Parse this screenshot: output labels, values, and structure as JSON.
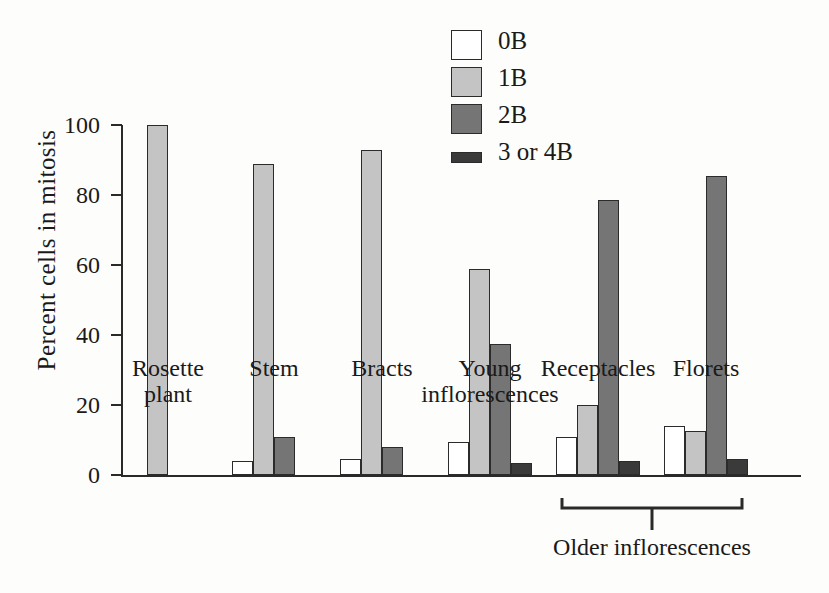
{
  "chart_data": {
    "type": "bar",
    "title": "",
    "xlabel": "",
    "ylabel": "Percent cells in mitosis",
    "ylim": [
      0,
      100
    ],
    "yticks": [
      0,
      20,
      40,
      60,
      80,
      100
    ],
    "grid": false,
    "legend_position": "top-center-right",
    "categories": [
      "Rosette plant",
      "Stem",
      "Bracts",
      "Young inflorescences",
      "Receptacles",
      "Florets"
    ],
    "category_lines": [
      [
        "Rosette",
        "plant"
      ],
      [
        "Stem",
        ""
      ],
      [
        "Bracts",
        ""
      ],
      [
        "Young",
        "inflorescences"
      ],
      [
        "Receptacles",
        ""
      ],
      [
        "Florets",
        ""
      ]
    ],
    "series": [
      {
        "name": "0B",
        "color": "#ffffff",
        "values": [
          0,
          4,
          4.5,
          9.5,
          11,
          14
        ]
      },
      {
        "name": "1B",
        "color": "#c4c4c4",
        "values": [
          100,
          89,
          93,
          59,
          20,
          12.5
        ]
      },
      {
        "name": "2B",
        "color": "#757575",
        "values": [
          0,
          11,
          8,
          37.5,
          78.5,
          85.5
        ]
      },
      {
        "name": "3 or 4B",
        "color": "#3a3a3a",
        "values": [
          0,
          0,
          0,
          3.5,
          4,
          4.5
        ]
      }
    ],
    "annotations": [
      {
        "text": "Older inflorescences",
        "spans_categories": [
          "Receptacles",
          "Florets"
        ],
        "type": "bracket"
      }
    ]
  },
  "legend": {
    "items": [
      {
        "label": "0B"
      },
      {
        "label": "1B"
      },
      {
        "label": "2B"
      },
      {
        "label": "3 or 4B"
      }
    ]
  },
  "axis": {
    "y_title": "Percent cells in mitosis",
    "y_tick_labels": [
      "100",
      "80",
      "60",
      "40",
      "20",
      "0"
    ]
  },
  "bracket": {
    "caption": "Older inflorescences"
  }
}
